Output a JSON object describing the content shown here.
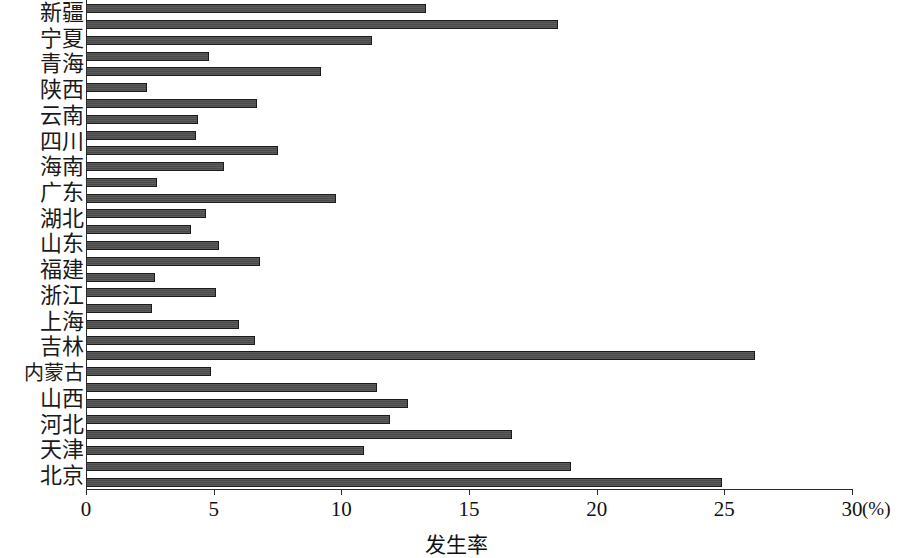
{
  "chart_data": {
    "type": "bar",
    "orientation": "horizontal",
    "title": "",
    "xlabel": "发生率",
    "ylabel": "",
    "unit_label": "(%)",
    "xlim": [
      0,
      30
    ],
    "xticks": [
      0,
      5,
      10,
      15,
      20,
      25,
      30
    ],
    "xtick_labels": [
      "0",
      "5",
      "10",
      "15",
      "20",
      "25",
      "30"
    ],
    "grid": false,
    "legend": null,
    "bar_color": "#4a4a4a",
    "bar_edge_color": "#1b1b1b",
    "categories": [
      "新疆",
      "宁夏",
      "青海",
      "陕西",
      "云南",
      "四川",
      "海南",
      "广东",
      "湖北",
      "山东",
      "福建",
      "浙江",
      "上海",
      "吉林",
      "内蒙古",
      "山西",
      "河北",
      "天津",
      "北京"
    ],
    "bars": [
      {
        "label": "新疆",
        "value": 13.3
      },
      {
        "label": "新疆",
        "value": 18.5
      },
      {
        "label": "宁夏",
        "value": 11.2
      },
      {
        "label": "宁夏",
        "value": 4.8
      },
      {
        "label": "青海",
        "value": 9.2
      },
      {
        "label": "青海",
        "value": 2.4
      },
      {
        "label": "陕西",
        "value": 6.7
      },
      {
        "label": "陕西",
        "value": 4.4
      },
      {
        "label": "云南",
        "value": 4.3
      },
      {
        "label": "云南",
        "value": 7.5
      },
      {
        "label": "四川",
        "value": 5.4
      },
      {
        "label": "四川",
        "value": 2.8
      },
      {
        "label": "海南",
        "value": 9.8
      },
      {
        "label": "海南",
        "value": 4.7
      },
      {
        "label": "广东",
        "value": 4.1
      },
      {
        "label": "广东",
        "value": 5.2
      },
      {
        "label": "湖北",
        "value": 6.8
      },
      {
        "label": "湖北",
        "value": 2.7
      },
      {
        "label": "山东",
        "value": 5.1
      },
      {
        "label": "山东",
        "value": 2.6
      },
      {
        "label": "福建",
        "value": 6.0
      },
      {
        "label": "浙江",
        "value": 6.6
      },
      {
        "label": "上海",
        "value": 26.2
      },
      {
        "label": "吉林",
        "value": 4.9
      },
      {
        "label": "内蒙古",
        "value": 11.4
      },
      {
        "label": "内蒙古",
        "value": 12.6
      },
      {
        "label": "山西",
        "value": 11.9
      },
      {
        "label": "山西",
        "value": 16.7
      },
      {
        "label": "河北",
        "value": 10.9
      },
      {
        "label": "天津",
        "value": 19.0
      },
      {
        "label": "北京",
        "value": 24.9
      }
    ]
  },
  "axis": {
    "x_title": "发生率",
    "unit": "(%)",
    "tick_labels": [
      "0",
      "5",
      "10",
      "15",
      "20",
      "25",
      "30"
    ]
  },
  "labels": [
    "新疆",
    "宁夏",
    "青海",
    "陕西",
    "云南",
    "四川",
    "海南",
    "广东",
    "湖北",
    "山东",
    "福建",
    "浙江",
    "上海",
    "吉林",
    "内蒙古",
    "山西",
    "河北",
    "天津",
    "北京"
  ]
}
